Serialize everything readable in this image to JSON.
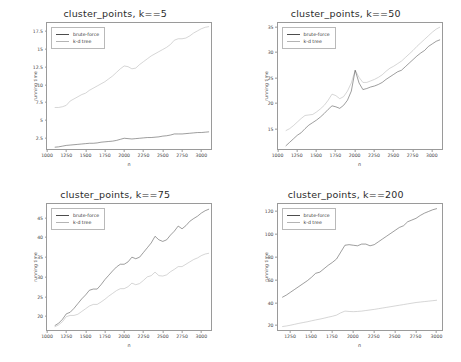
{
  "figure": {
    "background": "#ffffff",
    "colors": {
      "brute_force": "#4d4d4d",
      "kd_tree": "#b4b4b4",
      "axis": "#9a9a9a"
    }
  },
  "legend": {
    "brute_force_label": "brute-force",
    "kd_tree_label": "k-d tree"
  },
  "chart_data": [
    {
      "type": "line",
      "title": "cluster_points, k==5",
      "xlabel": "n",
      "ylabel": "running time",
      "xlim": [
        1000,
        3125
      ],
      "ylim": [
        1.0,
        18.6
      ],
      "xticks": [
        1000,
        1250,
        1500,
        1750,
        2000,
        2250,
        2500,
        2750,
        3000
      ],
      "yticks": [
        2.5,
        5.0,
        7.5,
        10.0,
        12.5,
        15.0,
        17.5
      ],
      "grid": false,
      "legend_position": "upper left",
      "x": [
        1100,
        1150,
        1200,
        1250,
        1300,
        1350,
        1400,
        1450,
        1500,
        1550,
        1600,
        1650,
        1700,
        1750,
        1800,
        1850,
        1900,
        1950,
        2000,
        2050,
        2100,
        2150,
        2200,
        2250,
        2300,
        2350,
        2400,
        2450,
        2500,
        2550,
        2600,
        2650,
        2700,
        2750,
        2800,
        2850,
        2900,
        2950,
        3000,
        3050,
        3100
      ],
      "series": [
        {
          "name": "k-d tree",
          "values": [
            6.8,
            6.8,
            6.9,
            7.1,
            7.7,
            8.0,
            8.3,
            8.6,
            8.8,
            9.2,
            9.5,
            9.8,
            10.1,
            10.4,
            10.8,
            11.2,
            11.7,
            12.2,
            12.6,
            12.5,
            12.2,
            12.3,
            12.8,
            13.2,
            13.6,
            14.0,
            14.3,
            14.6,
            14.9,
            15.2,
            15.6,
            16.2,
            16.4,
            16.4,
            16.5,
            16.8,
            17.2,
            17.5,
            17.8,
            18.0,
            18.1
          ]
        },
        {
          "name": "brute-force",
          "values": [
            1.25,
            1.3,
            1.4,
            1.5,
            1.55,
            1.6,
            1.65,
            1.7,
            1.75,
            1.8,
            1.8,
            1.85,
            1.95,
            2.0,
            2.05,
            2.1,
            2.2,
            2.35,
            2.5,
            2.45,
            2.4,
            2.45,
            2.5,
            2.55,
            2.6,
            2.6,
            2.65,
            2.7,
            2.8,
            2.85,
            2.95,
            3.1,
            3.1,
            3.1,
            3.15,
            3.2,
            3.25,
            3.3,
            3.3,
            3.35,
            3.4
          ]
        }
      ]
    },
    {
      "type": "line",
      "title": "cluster_points, k==50",
      "xlabel": "n",
      "ylabel": "running time",
      "xlim": [
        1000,
        3125
      ],
      "ylim": [
        11.0,
        35.8
      ],
      "xticks": [
        1000,
        1250,
        1500,
        1750,
        2000,
        2250,
        2500,
        2750,
        3000
      ],
      "yticks": [
        15,
        20,
        25,
        30,
        35
      ],
      "grid": false,
      "legend_position": "upper left",
      "x": [
        1100,
        1150,
        1200,
        1250,
        1300,
        1350,
        1400,
        1450,
        1500,
        1550,
        1600,
        1650,
        1700,
        1750,
        1800,
        1850,
        1900,
        1950,
        2000,
        2050,
        2100,
        2150,
        2200,
        2250,
        2300,
        2350,
        2400,
        2450,
        2500,
        2550,
        2600,
        2650,
        2700,
        2750,
        2800,
        2850,
        2900,
        2950,
        3000,
        3050,
        3100
      ],
      "series": [
        {
          "name": "k-d tree",
          "values": [
            14.6,
            15.0,
            15.6,
            16.3,
            17.0,
            17.6,
            17.7,
            17.8,
            18.3,
            18.9,
            19.6,
            20.6,
            21.8,
            21.5,
            20.9,
            21.3,
            22.4,
            24.0,
            26.5,
            25.1,
            24.1,
            24.1,
            24.4,
            24.7,
            25.1,
            25.6,
            26.3,
            26.9,
            27.3,
            27.8,
            28.3,
            29.0,
            29.7,
            30.4,
            31.2,
            31.9,
            32.6,
            33.3,
            34.0,
            34.6,
            35.0
          ]
        },
        {
          "name": "brute-force",
          "values": [
            11.6,
            12.3,
            13.0,
            13.7,
            14.2,
            15.0,
            15.7,
            16.2,
            16.7,
            17.3,
            18.0,
            18.8,
            19.5,
            19.3,
            19.0,
            19.6,
            20.6,
            22.4,
            26.5,
            24.0,
            22.7,
            22.9,
            23.2,
            23.4,
            23.7,
            24.1,
            24.7,
            25.2,
            25.7,
            26.2,
            26.5,
            27.2,
            27.9,
            28.6,
            29.3,
            29.9,
            30.4,
            31.2,
            31.7,
            32.2,
            32.5
          ]
        }
      ]
    },
    {
      "type": "line",
      "title": "cluster_points, k==75",
      "xlabel": "n",
      "ylabel": "running time",
      "xlim": [
        1000,
        3125
      ],
      "ylim": [
        16.5,
        48.5
      ],
      "xticks": [
        1000,
        1250,
        1500,
        1750,
        2000,
        2250,
        2500,
        2750,
        3000
      ],
      "yticks": [
        20,
        25,
        30,
        35,
        40,
        45
      ],
      "grid": false,
      "legend_position": "upper left",
      "x": [
        1100,
        1150,
        1200,
        1250,
        1300,
        1350,
        1400,
        1450,
        1500,
        1550,
        1600,
        1650,
        1700,
        1750,
        1800,
        1850,
        1900,
        1950,
        2000,
        2050,
        2100,
        2150,
        2200,
        2250,
        2300,
        2350,
        2400,
        2450,
        2500,
        2550,
        2600,
        2650,
        2700,
        2750,
        2800,
        2850,
        2900,
        2950,
        3000,
        3050,
        3100
      ],
      "series": [
        {
          "name": "brute-force",
          "values": [
            17.6,
            18.2,
            19.2,
            20.6,
            21.0,
            22.0,
            23.2,
            24.4,
            25.4,
            26.6,
            26.9,
            26.9,
            28.0,
            29.3,
            30.4,
            31.5,
            32.5,
            33.2,
            33.2,
            33.8,
            35.0,
            34.6,
            35.0,
            36.2,
            37.4,
            38.6,
            40.3,
            39.4,
            39.0,
            39.4,
            40.6,
            41.6,
            42.9,
            42.2,
            43.0,
            44.1,
            44.8,
            45.4,
            46.2,
            46.8,
            47.2
          ]
        },
        {
          "name": "k-d tree",
          "values": [
            17.3,
            17.8,
            18.6,
            19.9,
            20.2,
            20.2,
            20.5,
            21.2,
            21.9,
            22.6,
            23.0,
            23.0,
            23.6,
            24.3,
            25.1,
            25.8,
            26.5,
            27.0,
            27.0,
            27.5,
            28.4,
            28.0,
            28.3,
            29.1,
            30.0,
            30.3,
            31.2,
            30.3,
            30.2,
            30.5,
            31.3,
            31.9,
            32.6,
            32.6,
            33.2,
            33.8,
            34.4,
            34.8,
            35.4,
            35.8,
            36.0
          ]
        }
      ]
    },
    {
      "type": "line",
      "title": "cluster_points, k==200",
      "xlabel": "n",
      "ylabel": "running time",
      "xlim": [
        1100,
        3060
      ],
      "ylim": [
        16.0,
        126.0
      ],
      "xticks": [
        1250,
        1500,
        1750,
        2000,
        2250,
        2500,
        2750,
        3000
      ],
      "yticks": [
        20,
        40,
        60,
        80,
        100,
        120
      ],
      "grid": false,
      "legend_position": "upper left",
      "x": [
        1150,
        1200,
        1250,
        1300,
        1350,
        1400,
        1450,
        1500,
        1550,
        1600,
        1650,
        1700,
        1750,
        1800,
        1850,
        1900,
        1950,
        2000,
        2050,
        2100,
        2150,
        2200,
        2250,
        2300,
        2350,
        2400,
        2450,
        2500,
        2550,
        2600,
        2650,
        2700,
        2750,
        2800,
        2850,
        2900,
        2950,
        3000
      ],
      "series": [
        {
          "name": "brute-force",
          "values": [
            44.5,
            46.5,
            49.0,
            51.5,
            54.0,
            56.5,
            59.0,
            62.0,
            65.5,
            66.5,
            69.5,
            72.5,
            75.0,
            78.0,
            84.0,
            90.0,
            90.5,
            90.0,
            89.5,
            91.0,
            91.0,
            89.5,
            90.5,
            93.0,
            95.5,
            98.0,
            100.5,
            103.0,
            105.5,
            107.0,
            110.5,
            112.0,
            113.5,
            116.0,
            118.0,
            119.5,
            121.0,
            122.0
          ]
        },
        {
          "name": "k-d tree",
          "values": [
            19.0,
            19.5,
            20.2,
            21.0,
            21.8,
            22.5,
            23.2,
            24.0,
            24.8,
            25.5,
            26.3,
            27.2,
            28.0,
            29.0,
            31.0,
            32.5,
            32.2,
            32.0,
            32.2,
            32.5,
            33.0,
            33.5,
            34.0,
            34.6,
            35.2,
            35.8,
            36.4,
            37.0,
            37.6,
            38.2,
            38.8,
            39.4,
            40.0,
            40.4,
            40.8,
            41.2,
            41.6,
            42.0
          ]
        }
      ]
    }
  ]
}
